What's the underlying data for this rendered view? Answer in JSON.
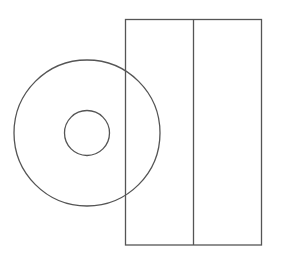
{
  "diagram": {
    "background": "#ffffff",
    "stroke_color": "#555555",
    "stroke_width": 1.3,
    "disc": {
      "cx": 87,
      "cy": 133,
      "outer_radius": 73,
      "inner_radius": 22.5
    },
    "rectangle": {
      "x": 125.5,
      "y": 19.5,
      "width": 136,
      "height": 225.5,
      "divider_x": 193.5
    }
  }
}
